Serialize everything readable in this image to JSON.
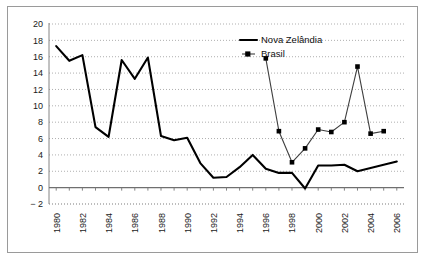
{
  "chart_data": {
    "type": "line",
    "title": "",
    "xlabel": "",
    "ylabel": "",
    "ylim": [
      -2,
      20
    ],
    "ytick_step": 2,
    "yticks": [
      "20",
      "18",
      "16",
      "14",
      "12",
      "10",
      "8",
      "6",
      "4",
      "2",
      "0",
      "− 2"
    ],
    "grid": true,
    "legend_position": "top-right",
    "x": [
      1980,
      1981,
      1982,
      1983,
      1984,
      1985,
      1986,
      1987,
      1988,
      1989,
      1990,
      1991,
      1992,
      1993,
      1994,
      1995,
      1996,
      1997,
      1998,
      1999,
      2000,
      2001,
      2002,
      2003,
      2004,
      2005,
      2006
    ],
    "xtick_labels": [
      "1980",
      "1982",
      "1984",
      "1986",
      "1988",
      "1990",
      "1992",
      "1994",
      "1996",
      "1998",
      "2000",
      "2002",
      "2004",
      "2006"
    ],
    "xtick_values": [
      1980,
      1982,
      1984,
      1986,
      1988,
      1990,
      1992,
      1994,
      1996,
      1998,
      2000,
      2002,
      2004,
      2006
    ],
    "series": [
      {
        "name": "Nova Zelândia",
        "marker": "none",
        "x": [
          1980,
          1981,
          1982,
          1983,
          1984,
          1985,
          1986,
          1987,
          1988,
          1989,
          1990,
          1991,
          1992,
          1993,
          1994,
          1995,
          1996,
          1997,
          1998,
          1999,
          2000,
          2001,
          2002,
          2003,
          2004,
          2005,
          2006
        ],
        "values": [
          17.3,
          15.5,
          16.2,
          7.4,
          6.2,
          15.6,
          13.3,
          15.9,
          6.3,
          5.8,
          6.1,
          3.0,
          1.2,
          1.3,
          2.5,
          4.0,
          2.3,
          1.8,
          1.8,
          -0.1,
          2.7,
          2.7,
          2.8,
          2.0,
          2.4,
          2.8,
          3.2
        ]
      },
      {
        "name": "Brasil",
        "marker": "square",
        "x": [
          1996,
          1997,
          1998,
          1999,
          2000,
          2001,
          2002,
          2003,
          2004,
          2005
        ],
        "values": [
          15.8,
          6.9,
          3.1,
          4.8,
          7.1,
          6.8,
          8.0,
          14.8,
          6.6,
          6.9
        ]
      }
    ]
  },
  "legend": {
    "items": [
      {
        "label": "Nova Zelândia"
      },
      {
        "label": "Brasil"
      }
    ]
  }
}
